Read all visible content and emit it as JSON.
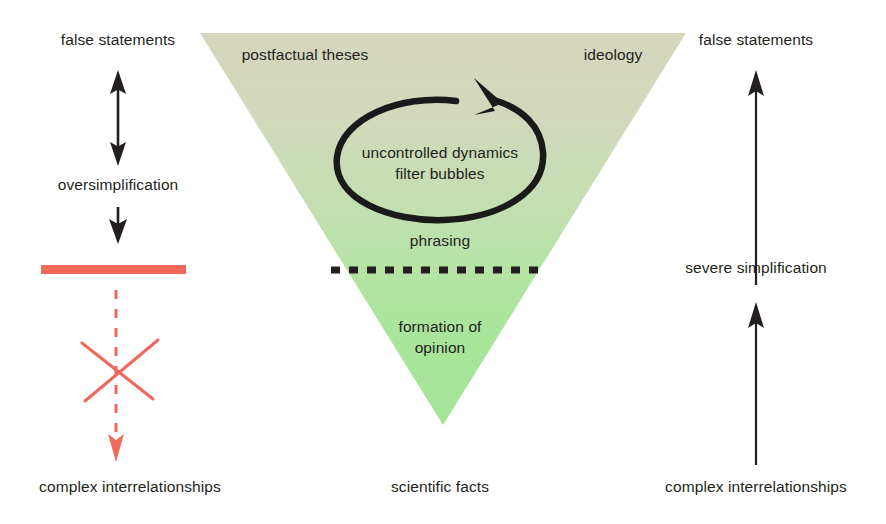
{
  "figure": {
    "type": "concept-diagram",
    "title_visible": false,
    "background_color": "#ffffff"
  },
  "colors": {
    "ink": "#231f20",
    "red_accent": "#f0685c",
    "triangle_top": "#d7d8bf",
    "triangle_bottom": "#a6e49a"
  },
  "triangle": {
    "name": "inverted-triangle",
    "top_label_left": "postfactual theses",
    "top_label_right": "ideology",
    "loop_label_line1": "uncontrolled dynamics",
    "loop_label_line2": "filter bubbles",
    "mid_label": "phrasing",
    "lower_label_line1": "formation of",
    "lower_label_line2": "opinion",
    "apex_label": "scientific facts",
    "divider": "dashed-line"
  },
  "left_axis": {
    "top_label": "false statements",
    "middle_label": "oversimplification",
    "bottom_label": "complex interrelationships",
    "double_arrow": "double-headed-vertical-arrow",
    "down_arrow": "down-arrow",
    "barrier": "red-bar",
    "blocked_marker": "red-x-cross",
    "blocked_arrow": "red-dashed-down-arrow"
  },
  "right_axis": {
    "top_label": "false statements",
    "middle_label": "severe simplification",
    "bottom_label": "complex interrelationships",
    "upper_arrow": "up-arrow",
    "lower_arrow": "up-arrow"
  }
}
